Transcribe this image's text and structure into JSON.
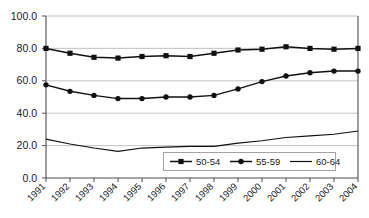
{
  "chart_data": {
    "type": "line",
    "title": "",
    "subtitle": "",
    "xlabel": "",
    "ylabel": "",
    "categories": [
      "1991",
      "1992",
      "1993",
      "1994",
      "1995",
      "1996",
      "1997",
      "1998",
      "1999",
      "2000",
      "2001",
      "2002",
      "2003",
      "2004"
    ],
    "ylim": [
      0.0,
      100.0
    ],
    "yticks": [
      "0.0",
      "20.0",
      "40.0",
      "60.0",
      "80.0",
      "100.0"
    ],
    "ytick_values": [
      0.0,
      20.0,
      40.0,
      60.0,
      80.0,
      100.0
    ],
    "grid": true,
    "legend_position": "inside-bottom-right",
    "series": [
      {
        "name": "50-54",
        "marker": "square",
        "values": [
          80.0,
          77.0,
          74.5,
          74.0,
          75.0,
          75.5,
          75.0,
          77.0,
          79.0,
          79.5,
          81.0,
          80.0,
          79.5,
          80.0
        ]
      },
      {
        "name": "55-59",
        "marker": "circle",
        "values": [
          57.5,
          53.5,
          51.0,
          49.0,
          49.0,
          50.0,
          50.0,
          51.0,
          55.0,
          59.5,
          63.0,
          65.0,
          66.0,
          66.0
        ]
      },
      {
        "name": "60-64",
        "marker": "none",
        "values": [
          24.0,
          21.0,
          18.5,
          16.5,
          18.5,
          19.0,
          19.5,
          19.5,
          21.5,
          23.0,
          25.0,
          26.0,
          27.0,
          29.0
        ]
      }
    ]
  },
  "legend": {
    "entries": [
      {
        "label": "50-54",
        "marker": "square"
      },
      {
        "label": "55-59",
        "marker": "circle"
      },
      {
        "label": "60-64",
        "marker": "none"
      }
    ]
  },
  "colors": {
    "series": "#111111",
    "grid": "#b3b3b3",
    "axis": "#4d4d4d",
    "background": "#ffffff"
  }
}
